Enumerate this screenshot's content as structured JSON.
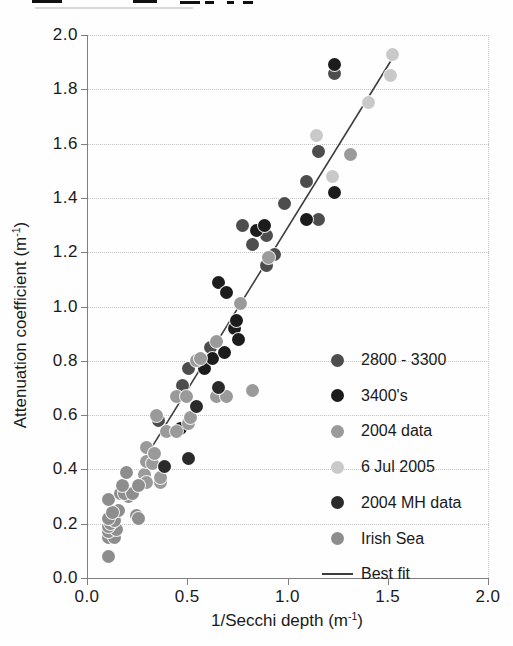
{
  "figure": {
    "y_axis_label": {
      "prefix": "Attenuation coefficient (m",
      "sup": "-1",
      "suffix": ")"
    },
    "x_axis_label": {
      "prefix": "1/Secchi depth (m",
      "sup": "-1",
      "suffix": ")"
    }
  },
  "chart_data": {
    "type": "scatter",
    "title": "",
    "xlabel": "1/Secchi depth (m-1)",
    "ylabel": "Attenuation coefficient (m-1)",
    "xlim": [
      0.0,
      2.0
    ],
    "ylim": [
      0.0,
      2.0
    ],
    "xtick_labels": [
      "0.0",
      "0.5",
      "1.0",
      "1.5",
      "2.0"
    ],
    "ytick_labels": [
      "0.0",
      "0.2",
      "0.4",
      "0.6",
      "0.8",
      "1.0",
      "1.2",
      "1.4",
      "1.6",
      "1.8",
      "2.0"
    ],
    "grid": "horizontal dotted gridlines at 0.2 intervals; dotted right and top frame",
    "legend_position": "inside lower-right",
    "series": [
      {
        "name": "2800 - 3300",
        "color": "#4d4d4d",
        "points": [
          [
            0.35,
            0.58
          ],
          [
            0.47,
            0.71
          ],
          [
            0.5,
            0.77
          ],
          [
            0.61,
            0.85
          ],
          [
            0.77,
            1.3
          ],
          [
            0.82,
            1.23
          ],
          [
            0.89,
            1.26
          ],
          [
            0.89,
            1.15
          ],
          [
            0.93,
            1.19
          ],
          [
            0.98,
            1.38
          ],
          [
            1.09,
            1.46
          ],
          [
            1.15,
            1.57
          ],
          [
            1.15,
            1.32
          ],
          [
            1.23,
            1.86
          ]
        ]
      },
      {
        "name": "3400's",
        "color": "#1c1c1c",
        "points": [
          [
            0.46,
            0.55
          ],
          [
            0.58,
            0.77
          ],
          [
            0.62,
            0.81
          ],
          [
            0.68,
            0.83
          ],
          [
            0.65,
            1.09
          ],
          [
            0.69,
            1.05
          ],
          [
            0.73,
            0.92
          ],
          [
            0.74,
            0.95
          ],
          [
            0.75,
            0.88
          ],
          [
            0.84,
            1.28
          ],
          [
            0.88,
            1.3
          ],
          [
            1.09,
            1.32
          ],
          [
            1.23,
            1.42
          ],
          [
            1.23,
            1.89
          ]
        ]
      },
      {
        "name": "2004 data",
        "color": "#9a9a9a",
        "points": [
          [
            0.28,
            0.38
          ],
          [
            0.29,
            0.35
          ],
          [
            0.29,
            0.43
          ],
          [
            0.29,
            0.48
          ],
          [
            0.32,
            0.42
          ],
          [
            0.33,
            0.46
          ],
          [
            0.34,
            0.6
          ],
          [
            0.36,
            0.35
          ],
          [
            0.36,
            0.37
          ],
          [
            0.39,
            0.54
          ],
          [
            0.44,
            0.54
          ],
          [
            0.44,
            0.67
          ],
          [
            0.49,
            0.67
          ],
          [
            0.5,
            0.57
          ],
          [
            0.51,
            0.59
          ],
          [
            0.54,
            0.8
          ],
          [
            0.56,
            0.81
          ],
          [
            0.64,
            0.87
          ],
          [
            0.64,
            0.67
          ],
          [
            0.69,
            0.67
          ],
          [
            0.76,
            1.01
          ],
          [
            0.82,
            0.69
          ],
          [
            0.9,
            1.18
          ],
          [
            1.31,
            1.56
          ]
        ]
      },
      {
        "name": "6 Jul 2005",
        "color": "#c9c9c9",
        "points": [
          [
            1.14,
            1.63
          ],
          [
            1.22,
            1.48
          ],
          [
            1.4,
            1.75
          ],
          [
            1.51,
            1.85
          ],
          [
            1.52,
            1.93
          ]
        ]
      },
      {
        "name": "2004 MH data",
        "color": "#2a2a2a",
        "points": [
          [
            0.38,
            0.41
          ],
          [
            0.5,
            0.44
          ],
          [
            0.54,
            0.63
          ],
          [
            0.65,
            0.7
          ]
        ]
      },
      {
        "name": "Irish Sea",
        "color": "#8d8d8d",
        "points": [
          [
            0.1,
            0.08
          ],
          [
            0.1,
            0.15
          ],
          [
            0.13,
            0.15
          ],
          [
            0.1,
            0.17
          ],
          [
            0.14,
            0.18
          ],
          [
            0.1,
            0.19
          ],
          [
            0.11,
            0.2
          ],
          [
            0.13,
            0.21
          ],
          [
            0.1,
            0.22
          ],
          [
            0.15,
            0.25
          ],
          [
            0.12,
            0.24
          ],
          [
            0.1,
            0.29
          ],
          [
            0.16,
            0.31
          ],
          [
            0.2,
            0.3
          ],
          [
            0.18,
            0.31
          ],
          [
            0.22,
            0.31
          ],
          [
            0.17,
            0.34
          ],
          [
            0.25,
            0.34
          ],
          [
            0.24,
            0.23
          ],
          [
            0.25,
            0.22
          ],
          [
            0.19,
            0.39
          ]
        ]
      }
    ],
    "best_fit": {
      "label": "Best fit",
      "color": "#3d3d3d",
      "from": [
        0.3,
        0.46
      ],
      "to": [
        1.54,
        1.94
      ]
    }
  }
}
